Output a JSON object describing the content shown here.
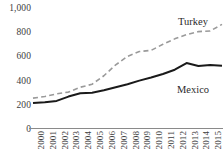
{
  "chart_data": {
    "type": "line",
    "title": "",
    "subtitle": "",
    "xlabel": "",
    "ylabel": "",
    "x": [
      2000,
      2001,
      2002,
      2003,
      2004,
      2005,
      2006,
      2007,
      2008,
      2009,
      2010,
      2011,
      2012,
      2013,
      2014,
      2015,
      2016
    ],
    "categories": [
      "2000",
      "2001",
      "2002",
      "2003",
      "2004",
      "2005",
      "2006",
      "2007",
      "2008",
      "2009",
      "2010",
      "2011",
      "2012",
      "2013",
      "2014",
      "2015",
      "2016"
    ],
    "series": [
      {
        "name": "Turkey",
        "style": "dashed",
        "color": "#9a9a9a",
        "values": [
          255,
          268,
          290,
          305,
          345,
          370,
          440,
          530,
          600,
          640,
          650,
          700,
          745,
          780,
          805,
          810,
          865
        ]
      },
      {
        "name": "Mexico",
        "style": "solid",
        "color": "#1a1a1a",
        "values": [
          215,
          222,
          232,
          268,
          295,
          300,
          320,
          345,
          370,
          400,
          425,
          455,
          490,
          545,
          520,
          528,
          522
        ]
      }
    ],
    "ylim": [
      0,
      1000
    ],
    "yticks": [
      0,
      200,
      400,
      600,
      800,
      1000
    ],
    "ytick_labels": [
      "0",
      "200",
      "400",
      "600",
      "800",
      "1,000"
    ],
    "xlim": [
      2000,
      2016
    ],
    "grid": false,
    "legend": "direct-labels-right",
    "axis_line": "x-only"
  },
  "labels": {
    "turkey": "Turkey",
    "mexico": "Mexico"
  }
}
